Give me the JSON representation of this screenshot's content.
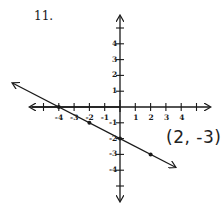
{
  "problem": {
    "number_label": "11."
  },
  "annotation": {
    "point_label": "(2, -3)"
  },
  "colors": {
    "ink": "#1a1a1a",
    "background": "#ffffff"
  },
  "chart_data": {
    "type": "line",
    "title": "",
    "xlabel": "",
    "ylabel": "",
    "xlim": [
      -5.5,
      5.5
    ],
    "ylim": [
      -5.5,
      5.5
    ],
    "grid": false,
    "x_tick_labels": [
      "-4",
      "-3",
      "-2",
      "-1",
      "1",
      "2",
      "3",
      "4"
    ],
    "y_tick_labels": [
      "4",
      "3",
      "2",
      "1",
      "-1",
      "-2",
      "-3",
      "-4"
    ],
    "series": [
      {
        "name": "line",
        "equation": "y = -0.5x - 2",
        "points": [
          {
            "x": -4,
            "y": 0
          },
          {
            "x": -2,
            "y": -1
          },
          {
            "x": 0,
            "y": -2
          },
          {
            "x": 2,
            "y": -3
          }
        ],
        "arrows_both_ends": true
      }
    ],
    "annotations": [
      {
        "text": "(2, -3)",
        "x": 2,
        "y": -3
      }
    ]
  }
}
